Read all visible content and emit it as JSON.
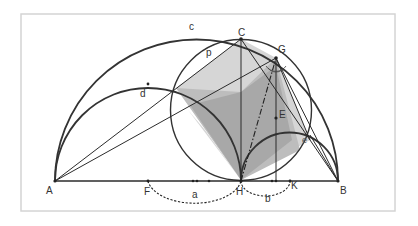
{
  "diagram": {
    "type": "geometry-construction",
    "labels": {
      "A": "A",
      "B": "B",
      "C": "C",
      "G": "G",
      "E": "E",
      "F": "F",
      "H": "H",
      "K": "K",
      "c": "c",
      "d": "d",
      "p": "p",
      "e": "e",
      "a": "a",
      "b": "b"
    },
    "colors": {
      "stroke": "#333333",
      "shade_light": "#d6d6d6",
      "shade_mid": "#bdbdbd",
      "shade_dark": "#a8a8a8",
      "frame": "#d4d4d4"
    }
  }
}
